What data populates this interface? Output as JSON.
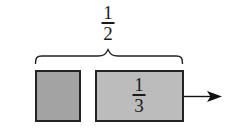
{
  "diagram": {
    "brace_label": {
      "numerator": "1",
      "denominator": "2"
    },
    "boxes": [
      {
        "id": "small-box",
        "fill": "#a3a3a3",
        "label": null
      },
      {
        "id": "large-box",
        "fill": "#bcbcbc",
        "label": {
          "numerator": "1",
          "denominator": "3"
        }
      }
    ],
    "arrow": {
      "direction": "right",
      "color": "#111111"
    },
    "colors": {
      "stroke": "#222222",
      "text": "#1a1a1a",
      "background": "#ffffff"
    }
  }
}
